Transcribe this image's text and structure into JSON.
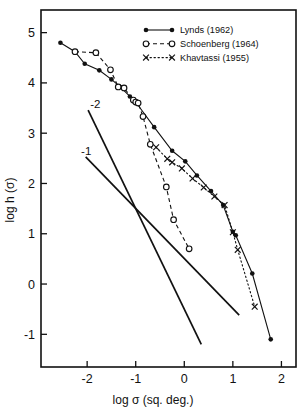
{
  "chart_data": {
    "type": "line",
    "title": "",
    "xlabel": "log σ (sq. deg.)",
    "ylabel": "log h (σ)",
    "xlim": [
      -2.95,
      2.3
    ],
    "ylim": [
      -1.65,
      5.45
    ],
    "xticks": [
      -2,
      -1,
      0,
      1,
      2
    ],
    "xtick_labels": [
      "-2",
      "-1",
      "0",
      "1",
      "2"
    ],
    "yticks": [
      -1,
      0,
      1,
      2,
      3,
      4,
      5
    ],
    "ytick_labels": [
      "-1",
      "0",
      "1",
      "2",
      "3",
      "4",
      "5"
    ],
    "grid": false,
    "legend_position": "top-right",
    "series": [
      {
        "name": "Lynds (1962)",
        "marker": "filled-circle",
        "line": "solid",
        "points": [
          [
            -2.55,
            4.8
          ],
          [
            -2.25,
            4.62
          ],
          [
            -2.05,
            4.38
          ],
          [
            -1.75,
            4.25
          ],
          [
            -1.5,
            4.07
          ],
          [
            -1.32,
            3.92
          ],
          [
            -1.12,
            3.73
          ],
          [
            -1.0,
            3.62
          ],
          [
            -0.62,
            3.12
          ],
          [
            -0.25,
            2.65
          ],
          [
            0.02,
            2.44
          ],
          [
            0.26,
            2.16
          ],
          [
            0.55,
            1.85
          ],
          [
            0.8,
            1.57
          ],
          [
            1.0,
            1.04
          ],
          [
            1.06,
            0.97
          ],
          [
            1.4,
            0.21
          ],
          [
            1.78,
            -1.1
          ]
        ]
      },
      {
        "name": "Schoenberg (1964)",
        "marker": "open-circle",
        "line": "dashed",
        "points": [
          [
            -2.25,
            4.62
          ],
          [
            -1.82,
            4.6
          ],
          [
            -1.52,
            4.26
          ],
          [
            -1.36,
            3.92
          ],
          [
            -1.24,
            3.9
          ],
          [
            -1.05,
            3.66
          ],
          [
            -1.0,
            3.62
          ],
          [
            -0.95,
            3.6
          ],
          [
            -0.85,
            3.33
          ],
          [
            -0.7,
            2.78
          ],
          [
            -0.37,
            1.93
          ],
          [
            -0.22,
            1.28
          ],
          [
            0.1,
            0.7
          ]
        ]
      },
      {
        "name": "Khavtassi (1955)",
        "marker": "cross",
        "line": "dotted",
        "points": [
          [
            -0.58,
            2.72
          ],
          [
            -0.35,
            2.49
          ],
          [
            -0.25,
            2.42
          ],
          [
            -0.05,
            2.3
          ],
          [
            0.17,
            2.1
          ],
          [
            0.4,
            1.92
          ],
          [
            0.62,
            1.74
          ],
          [
            0.83,
            1.57
          ],
          [
            1.0,
            1.03
          ],
          [
            1.1,
            0.68
          ],
          [
            1.45,
            -0.45
          ]
        ]
      }
    ],
    "reference_lines": [
      {
        "label": "-2",
        "slope": -2,
        "x_start": -1.98,
        "y_start": 3.46,
        "x_end": 0.35,
        "y_end": -1.2
      },
      {
        "label": "-1",
        "slope": -1,
        "x_start": -2.03,
        "y_start": 2.53,
        "x_end": 1.13,
        "y_end": -0.62
      }
    ],
    "reference_line_labels": [
      {
        "text": "-2",
        "x": -1.83,
        "y": 3.5
      },
      {
        "text": "-1",
        "x": -2.02,
        "y": 2.56
      }
    ]
  },
  "legend": {
    "entries": [
      {
        "label": "Lynds (1962)",
        "marker": "filled-circle",
        "line": "solid"
      },
      {
        "label": "Schoenberg (1964)",
        "marker": "open-circle",
        "line": "dashed"
      },
      {
        "label": "Khavtassi (1955)",
        "marker": "cross",
        "line": "dotted"
      }
    ]
  },
  "colors": {
    "ink": "#111111",
    "background": "#ffffff"
  }
}
